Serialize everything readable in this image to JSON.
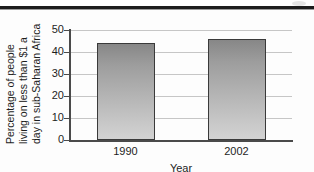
{
  "figure": {
    "background_color": "#fdfdfd",
    "top_rule_color": "#1b1b1b"
  },
  "chart_data": {
    "type": "bar",
    "title": "",
    "subtitle": "",
    "xlabel": "Year",
    "ylabel": "Percentage of people living on less than $1 a day in sub-Saharan Africa",
    "ylabel_lines": [
      "Percentage of people",
      "living on less than $1 a",
      "day in sub-Saharan Africa"
    ],
    "categories": [
      "1990",
      "2002"
    ],
    "values": [
      44,
      46
    ],
    "ylim": [
      0,
      50
    ],
    "yticks": [
      0,
      10,
      20,
      30,
      40,
      50
    ],
    "ytick_labels": [
      "0",
      "10",
      "20",
      "30",
      "40",
      "50"
    ],
    "grid": true,
    "grid_axis": "y",
    "grid_color": "#c6c6c6",
    "legend": false,
    "legend_position": "none",
    "bar_fill_top": "#878787",
    "bar_fill_bottom": "#d2d2d2",
    "bar_edge_color": "#3a3a3a",
    "axis_color": "#4a4a4a"
  }
}
